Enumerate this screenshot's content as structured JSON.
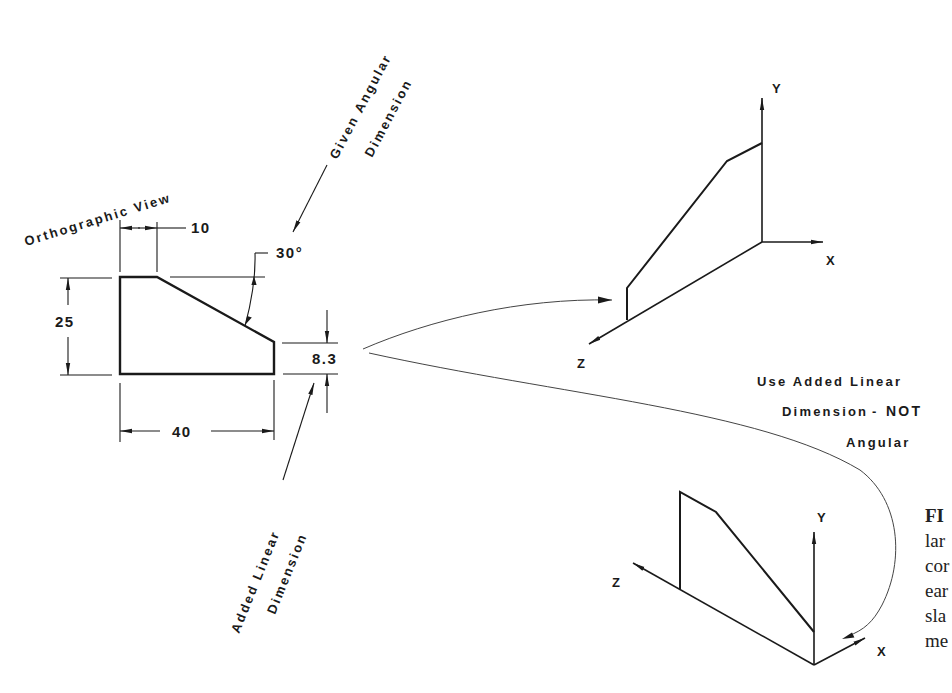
{
  "figure": {
    "orthographic_view": {
      "title": "Orthographic View",
      "dimensions": {
        "top_width": "10",
        "angle": "30°",
        "height": "25",
        "overall_width": "40",
        "added_linear": "8.3"
      }
    },
    "callouts": {
      "given_angular_line1": "Given Angular",
      "given_angular_line2": "Dimension",
      "added_linear_line1": "Added Linear",
      "added_linear_line2": "Dimension",
      "note_line1": "Use Added Linear",
      "note_line2_a": "Dimension",
      "note_line2_b": "NOT",
      "note_line3": "Angular"
    },
    "isometric_top": {
      "axis_x": "X",
      "axis_y": "Y",
      "axis_z": "Z"
    },
    "isometric_bottom": {
      "axis_x": "X",
      "axis_y": "Y",
      "axis_z": "Z"
    },
    "caption_fragments": {
      "line1": "FI",
      "line2": "lar",
      "line3": "cor",
      "line4": "ear",
      "line5": "sla",
      "line6": "me"
    }
  }
}
